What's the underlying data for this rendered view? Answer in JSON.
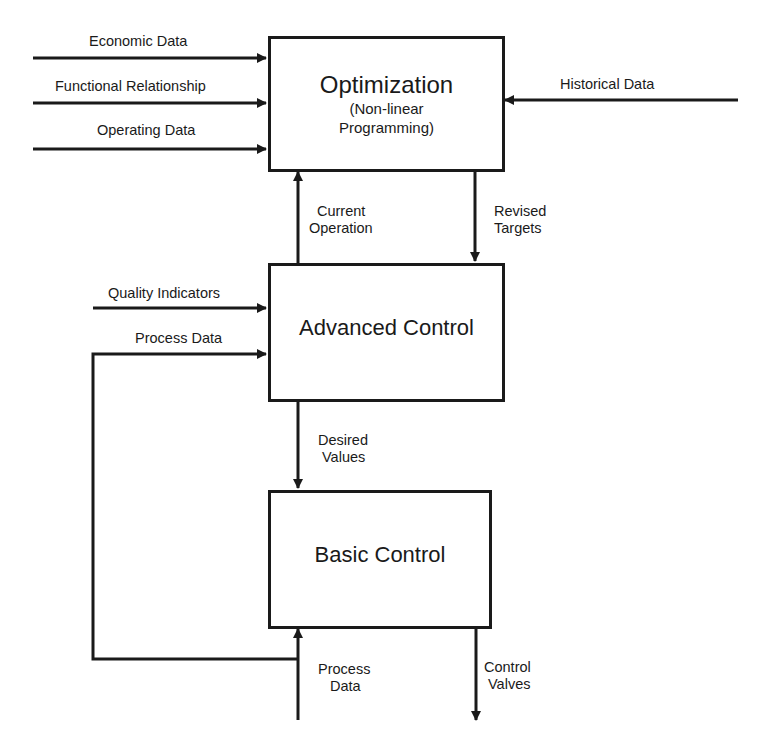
{
  "diagram": {
    "type": "hierarchical control block diagram",
    "blocks": {
      "optimization": {
        "title": "Optimization",
        "subtitle_line1": "(Non-linear",
        "subtitle_line2": "Programming)"
      },
      "advanced_control": {
        "title": "Advanced Control"
      },
      "basic_control": {
        "title": "Basic Control"
      }
    },
    "inputs": {
      "economic_data": "Economic Data",
      "functional_relationship": "Functional Relationship",
      "operating_data": "Operating Data",
      "historical_data": "Historical Data",
      "quality_indicators": "Quality Indicators",
      "process_data_feedback": "Process Data"
    },
    "links": {
      "current_operation": {
        "line1": "Current",
        "line2": "Operation"
      },
      "revised_targets": {
        "line1": "Revised",
        "line2": "Targets"
      },
      "desired_values": {
        "line1": "Desired",
        "line2": "Values"
      },
      "process_data_in": {
        "line1": "Process",
        "line2": "Data"
      },
      "control_valves": {
        "line1": "Control",
        "line2": "Valves"
      }
    },
    "colors": {
      "ink": "#1a1a1a",
      "background": "#ffffff"
    }
  }
}
